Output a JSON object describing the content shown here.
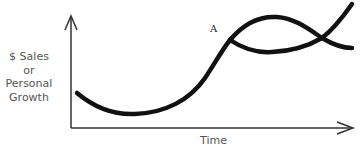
{
  "diagram": {
    "y_axis_label": [
      "$ Sales",
      "or",
      "Personal",
      "Growth"
    ],
    "x_axis_label": "Time",
    "point_label": "A",
    "colors": {
      "curve": "#111111",
      "axis": "#333333",
      "label_text": "#555555",
      "background": "#ffffff"
    },
    "curves": [
      {
        "name": "main-growth-curve",
        "description": "Dips then rises to point A"
      },
      {
        "name": "upper-branch",
        "description": "From A arcs up then continues rising (second S-curve)"
      },
      {
        "name": "lower-branch",
        "description": "From A sags then declines after crossing"
      }
    ]
  }
}
